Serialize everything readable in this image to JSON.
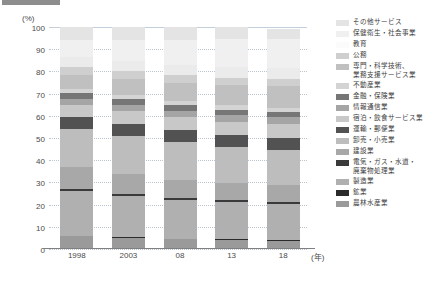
{
  "chart_data": {
    "type": "bar",
    "stacked": true,
    "title": "",
    "xlabel": "(年)",
    "ylabel": "(%)",
    "ylim": [
      0,
      100
    ],
    "yticks": [
      0,
      10,
      20,
      30,
      40,
      50,
      60,
      70,
      80,
      90,
      100
    ],
    "grid": true,
    "legend_position": "right",
    "categories": [
      "1998",
      "2003",
      "08",
      "13",
      "18"
    ],
    "series": [
      {
        "name": "農林水産業",
        "color": "#9a9a9a",
        "values": [
          5.6,
          5.0,
          4.3,
          4.0,
          3.6
        ]
      },
      {
        "name": "鉱業",
        "color": "#2b2b2b",
        "values": [
          0.4,
          0.3,
          0.3,
          0.3,
          0.3
        ]
      },
      {
        "name": "製造業",
        "color": "#b0b0b0",
        "values": [
          20.0,
          18.5,
          17.5,
          16.8,
          16.4
        ]
      },
      {
        "name": "電気・ガス・水道・\n廃棄物処理業",
        "color": "#3a3a3a",
        "values": [
          0.9,
          0.9,
          0.9,
          0.9,
          0.9
        ]
      },
      {
        "name": "建設業",
        "color": "#a8a8a8",
        "values": [
          10.2,
          9.2,
          8.2,
          7.6,
          7.4
        ]
      },
      {
        "name": "卸売・小売業",
        "color": "#bdbdbd",
        "values": [
          16.8,
          17.0,
          16.8,
          16.4,
          16.1
        ]
      },
      {
        "name": "運輸・郵便業",
        "color": "#525252",
        "values": [
          5.6,
          5.6,
          5.5,
          5.4,
          5.4
        ]
      },
      {
        "name": "宿泊・飲食サービス業",
        "color": "#c8c8c8",
        "values": [
          5.4,
          5.6,
          5.8,
          5.9,
          6.0
        ]
      },
      {
        "name": "情報通信業",
        "color": "#a5a5a5",
        "values": [
          2.6,
          2.9,
          3.0,
          3.1,
          3.2
        ]
      },
      {
        "name": "金融・保険業",
        "color": "#767676",
        "values": [
          2.9,
          2.6,
          2.5,
          2.4,
          2.4
        ]
      },
      {
        "name": "不動産業",
        "color": "#d4d4d4",
        "values": [
          1.6,
          1.7,
          1.8,
          1.9,
          2.0
        ]
      },
      {
        "name": "専門・科学技術、\n業務支援サービス業",
        "color": "#c0c0c0",
        "values": [
          6.2,
          7.3,
          8.2,
          9.0,
          9.6
        ]
      },
      {
        "name": "公務",
        "color": "#cfcfcf",
        "values": [
          3.6,
          3.5,
          3.4,
          3.3,
          3.3
        ]
      },
      {
        "name": "教育",
        "color": "#ebebeb",
        "values": [
          4.6,
          4.7,
          4.8,
          4.9,
          5.0
        ]
      },
      {
        "name": "保健衛生・社会事業",
        "color": "#f0f0f0",
        "values": [
          7.6,
          9.2,
          11.0,
          12.5,
          13.2
        ]
      },
      {
        "name": "その他サービス",
        "color": "#e4e4e4",
        "values": [
          6.0,
          6.0,
          6.0,
          5.6,
          4.2
        ]
      }
    ]
  },
  "legend": {
    "items": [
      {
        "label": "その他サービス",
        "color": "#e4e4e4"
      },
      {
        "label": "保健衛生・社会事業",
        "color": "#f0f0f0"
      },
      {
        "label": "教育",
        "color": "#fbfbfb"
      },
      {
        "label": "公務",
        "color": "#cfcfcf"
      },
      {
        "label": "専門・科学技術、\n業務支援サービス業",
        "color": "#c0c0c0"
      },
      {
        "label": "不動産業",
        "color": "#d4d4d4"
      },
      {
        "label": "金融・保険業",
        "color": "#767676"
      },
      {
        "label": "情報通信業",
        "color": "#a5a5a5"
      },
      {
        "label": "宿泊・飲食サービス業",
        "color": "#c8c8c8"
      },
      {
        "label": "運輸・郵便業",
        "color": "#525252"
      },
      {
        "label": "卸売・小売業",
        "color": "#bdbdbd"
      },
      {
        "label": "建設業",
        "color": "#a8a8a8"
      },
      {
        "label": "電気・ガス・水道・\n廃棄物処理業",
        "color": "#3a3a3a"
      },
      {
        "label": "製造業",
        "color": "#b0b0b0"
      },
      {
        "label": "鉱業",
        "color": "#2b2b2b"
      },
      {
        "label": "農林水産業",
        "color": "#9a9a9a"
      }
    ]
  },
  "axes": {
    "y_unit": "(%)",
    "x_unit": "(年)"
  }
}
